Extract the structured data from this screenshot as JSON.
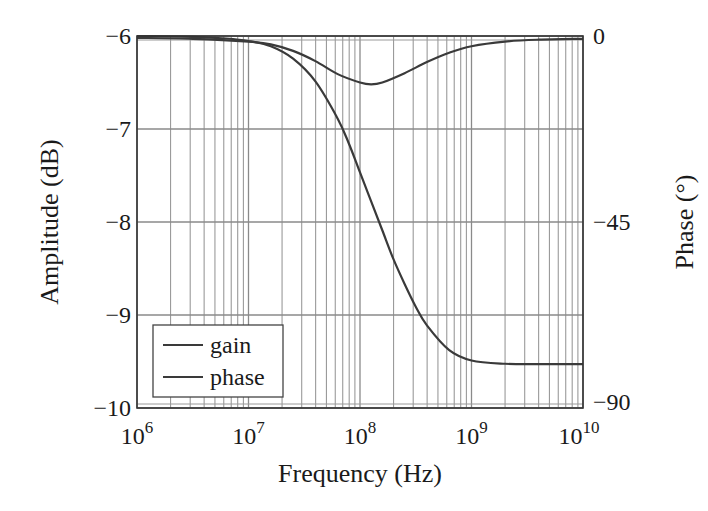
{
  "chart_data": {
    "type": "line",
    "title": "",
    "xlabel": "Frequency (Hz)",
    "ylabel": "Amplitude (dB)",
    "y2label": "Phase (°)",
    "xscale": "log",
    "xlim": [
      1000000,
      10000000000
    ],
    "ylim": [
      -10,
      -6
    ],
    "y2lim": [
      -90,
      0
    ],
    "x_ticks": [
      {
        "exp": 6,
        "base": "10",
        "sup": "6"
      },
      {
        "exp": 7,
        "base": "10",
        "sup": "7"
      },
      {
        "exp": 8,
        "base": "10",
        "sup": "8"
      },
      {
        "exp": 9,
        "base": "10",
        "sup": "9"
      },
      {
        "exp": 10,
        "base": "10",
        "sup": "10"
      }
    ],
    "y_ticks": [
      {
        "value": -6,
        "label": "−6"
      },
      {
        "value": -7,
        "label": "−7"
      },
      {
        "value": -8,
        "label": "−8"
      },
      {
        "value": -9,
        "label": "−9"
      },
      {
        "value": -10,
        "label": "−10"
      }
    ],
    "y2_ticks": [
      {
        "value": 0,
        "label": "0"
      },
      {
        "value": -45,
        "label": "−45"
      },
      {
        "value": -90,
        "label": "−90"
      }
    ],
    "grid": true,
    "legend_position": "lower left",
    "series": [
      {
        "name": "gain",
        "axis": "left",
        "color": "#3a3a3a",
        "log10_x": [
          6.0,
          6.5,
          7.0,
          7.2,
          7.4,
          7.6,
          7.8,
          8.0,
          8.1,
          8.2,
          8.4,
          8.6,
          8.8,
          9.0,
          9.3,
          9.6,
          10.0
        ],
        "values": [
          -6.02,
          -6.03,
          -6.06,
          -6.09,
          -6.16,
          -6.27,
          -6.41,
          -6.5,
          -6.52,
          -6.5,
          -6.4,
          -6.28,
          -6.18,
          -6.11,
          -6.06,
          -6.04,
          -6.03
        ]
      },
      {
        "name": "phase",
        "axis": "right",
        "color": "#3a3a3a",
        "log10_x": [
          6.0,
          6.5,
          6.8,
          7.0,
          7.2,
          7.4,
          7.6,
          7.8,
          7.9,
          8.0,
          8.1,
          8.2,
          8.3,
          8.4,
          8.5,
          8.6,
          8.8,
          9.0,
          9.3,
          9.6,
          10.0
        ],
        "values": [
          0,
          -0.2,
          -0.6,
          -1.2,
          -2.5,
          -5.5,
          -11,
          -20,
          -26,
          -33,
          -40,
          -47,
          -54,
          -60,
          -65.5,
          -70,
          -76,
          -78.5,
          -79.3,
          -79.4,
          -79.4
        ]
      }
    ]
  }
}
